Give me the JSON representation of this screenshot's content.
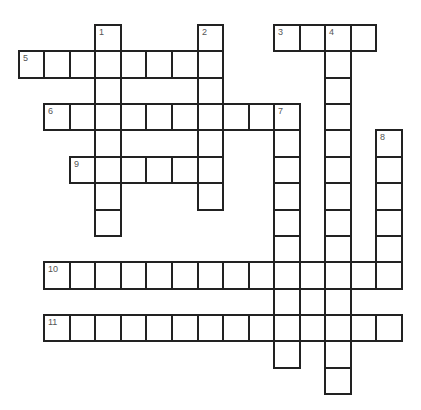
{
  "puzzle": {
    "type": "crossword",
    "grid": {
      "origin_x": 17.8,
      "origin_y": 24,
      "cell_width": 25.53,
      "cell_height": 26.36,
      "columns": 15,
      "rows": 14,
      "border_color": "#222222",
      "number_color": "#555555"
    },
    "words": [
      {
        "number": "1",
        "direction": "down",
        "row": 0,
        "col": 3,
        "length": 8
      },
      {
        "number": "2",
        "direction": "down",
        "row": 0,
        "col": 7,
        "length": 7
      },
      {
        "number": "3",
        "direction": "across",
        "row": 0,
        "col": 10,
        "length": 4
      },
      {
        "number": "4",
        "direction": "down",
        "row": 0,
        "col": 12,
        "length": 14
      },
      {
        "number": "5",
        "direction": "across",
        "row": 1,
        "col": 0,
        "length": 8
      },
      {
        "number": "6",
        "direction": "across",
        "row": 3,
        "col": 1,
        "length": 10
      },
      {
        "number": "7",
        "direction": "down",
        "row": 3,
        "col": 10,
        "length": 10
      },
      {
        "number": "8",
        "direction": "down",
        "row": 4,
        "col": 14,
        "length": 6
      },
      {
        "number": "9",
        "direction": "across",
        "row": 5,
        "col": 2,
        "length": 6
      },
      {
        "number": "10",
        "direction": "across",
        "row": 9,
        "col": 1,
        "length": 14
      },
      {
        "number": "11",
        "direction": "across",
        "row": 11,
        "col": 1,
        "length": 14
      }
    ]
  }
}
